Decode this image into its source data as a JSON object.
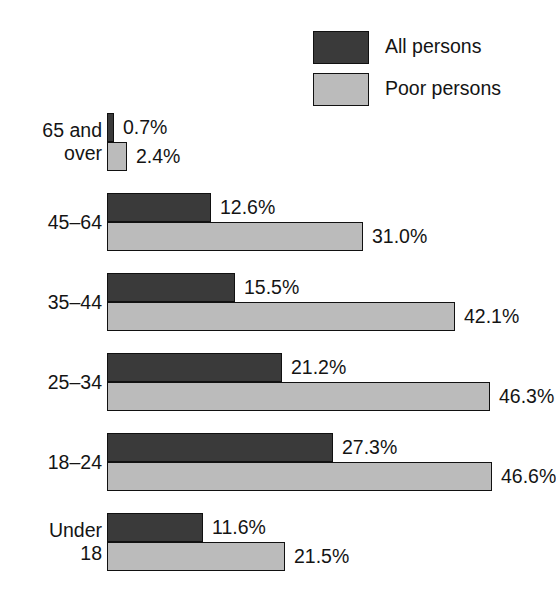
{
  "legend": {
    "items": [
      {
        "label": "All persons",
        "swatch": "dark-swatch",
        "color": "#3a3a3a"
      },
      {
        "label": "Poor persons",
        "swatch": "light-swatch",
        "color": "#bbbbbb"
      }
    ]
  },
  "chart_data": {
    "type": "bar",
    "orientation": "horizontal",
    "title": "",
    "subtitle": "",
    "xlabel": "",
    "ylabel": "",
    "xlim": [
      0,
      50
    ],
    "grid": false,
    "legend_position": "top-right",
    "categories": [
      "65 and over",
      "45–64",
      "35–44",
      "25–34",
      "18–24",
      "Under 18"
    ],
    "category_lines": [
      [
        "65 and",
        "over"
      ],
      [
        "45–64"
      ],
      [
        "35–44"
      ],
      [
        "25–34"
      ],
      [
        "18–24"
      ],
      [
        "Under",
        "18"
      ]
    ],
    "series": [
      {
        "name": "All persons",
        "color": "#3a3a3a",
        "values": [
          0.7,
          12.6,
          15.5,
          21.2,
          27.3,
          11.6
        ],
        "labels": [
          "0.7%",
          "12.6%",
          "15.5%",
          "21.2%",
          "27.3%",
          "11.6%"
        ]
      },
      {
        "name": "Poor persons",
        "color": "#bbbbbb",
        "values": [
          2.4,
          31.0,
          42.1,
          46.3,
          46.6,
          21.5
        ],
        "labels": [
          "2.4%",
          "31.0%",
          "42.1%",
          "46.3%",
          "46.6%",
          "21.5%"
        ]
      }
    ]
  },
  "layout": {
    "baseline_x": 107,
    "px_per_percent": 8.27,
    "bar_height": 29,
    "group_tops": [
      113,
      193,
      273,
      353,
      433,
      513
    ]
  }
}
